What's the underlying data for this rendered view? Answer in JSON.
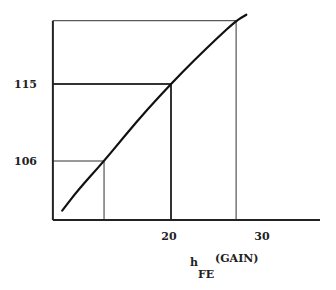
{
  "chart_data": {
    "type": "line",
    "title": "",
    "xlabel": {
      "main": "h",
      "subscript": "FE",
      "suffix": "(GAIN)"
    },
    "ylabel": "",
    "xlim": [
      7.3,
      35
    ],
    "ylim": [
      99.1,
      122.4
    ],
    "x_ticks": [
      {
        "value": 20,
        "label": "20"
      },
      {
        "value": 30,
        "label": "30"
      }
    ],
    "y_ticks": [
      {
        "value": 115,
        "label": "115"
      },
      {
        "value": 106,
        "label": "106"
      }
    ],
    "grid": false,
    "legend": "none",
    "series": [
      {
        "name": "curve",
        "x": [
          8.3,
          10,
          12.8,
          15,
          17.5,
          20,
          22.5,
          25,
          27,
          28.1
        ],
        "y": [
          100.2,
          102.6,
          106,
          108.9,
          112.1,
          115,
          117.8,
          120.4,
          122.4,
          123.1
        ]
      }
    ],
    "reference_lines": [
      {
        "name": "ref-106",
        "x": 12.8,
        "y": 106,
        "weight": "thin"
      },
      {
        "name": "ref-115",
        "x": 20,
        "y": 115,
        "weight": "thick"
      },
      {
        "name": "ref-top",
        "x": 27,
        "y": 122.4,
        "weight": "thin"
      }
    ]
  }
}
